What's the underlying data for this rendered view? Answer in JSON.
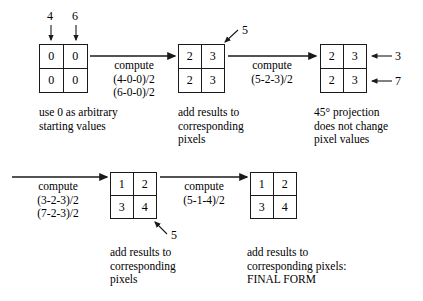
{
  "top_row": {
    "input_labels": {
      "left": "4",
      "right": "6"
    },
    "grid1": {
      "name": "starting-grid",
      "cells": [
        "0",
        "0",
        "0",
        "0"
      ]
    },
    "arrow1_label": "compute\n(4-0-0)/2\n(6-0-0)/2",
    "grid1_caption": "use 0 as arbitrary\nstarting values",
    "grid2": {
      "name": "grid-after-first-compute",
      "cells": [
        "2",
        "3",
        "2",
        "3"
      ]
    },
    "grid2_diagonal_label": "5",
    "grid2_caption": "add results to\ncorresponding\npixels",
    "arrow2_label": "compute\n(5-2-3)/2",
    "grid3": {
      "name": "grid-after-45-projection",
      "cells": [
        "2",
        "3",
        "2",
        "3"
      ]
    },
    "grid3_side_labels": {
      "top": "3",
      "bottom": "7"
    },
    "grid3_caption": "45° projection\ndoes not change\npixel values"
  },
  "bottom_row": {
    "arrow3_label": "compute\n(3-2-3)/2\n(7-2-3)/2",
    "grid4": {
      "name": "grid-after-row-compute",
      "cells": [
        "1",
        "2",
        "3",
        "4"
      ]
    },
    "grid4_diagonal_label": "5",
    "grid4_caption": "add results to\ncorresponding\npixels",
    "arrow4_label": "compute\n(5-1-4)/2",
    "grid5": {
      "name": "final-grid",
      "cells": [
        "1",
        "2",
        "3",
        "4"
      ]
    },
    "grid5_caption": "add results to\ncorresponding pixels:\nFINAL FORM"
  },
  "colors": {
    "stroke": "#1a1a1a",
    "background": "#ffffff",
    "text": "#000000"
  }
}
